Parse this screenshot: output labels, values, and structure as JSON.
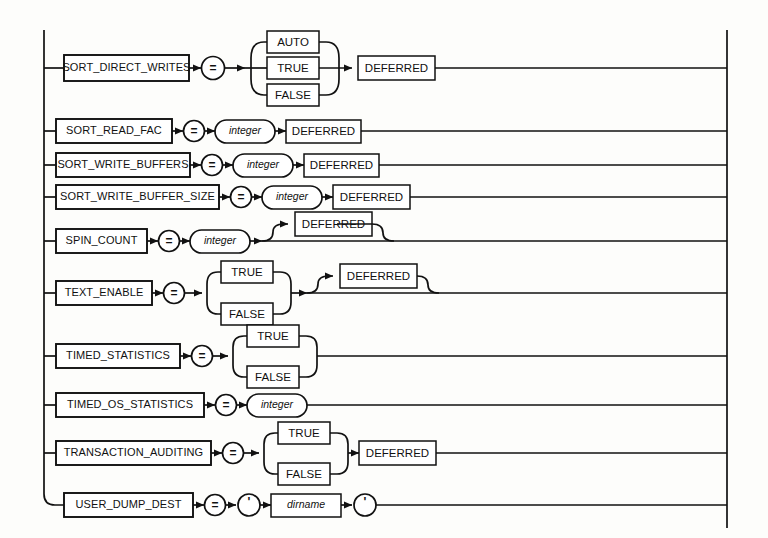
{
  "diagram": {
    "kind": "railroad-syntax-diagram",
    "colors": {
      "ink": "#111111",
      "paper": "#fdfdfb"
    },
    "rail": {
      "left_x": 44,
      "right_x": 727
    },
    "terminals": {
      "auto": "AUTO",
      "true": "TRUE",
      "false": "FALSE",
      "deferred": "DEFERRED",
      "equals": "=",
      "quote": "'"
    },
    "nonterminals": {
      "integer": "integer",
      "dirname": "dirname"
    },
    "rows": [
      {
        "id": "sort-direct-writes",
        "parameter": "SORT_DIRECT_WRITES",
        "operator": "=",
        "choices": [
          "AUTO",
          "TRUE",
          "FALSE"
        ],
        "trailing": "DEFERRED",
        "trailing_optional": false
      },
      {
        "id": "sort-read-fac",
        "parameter": "SORT_READ_FAC",
        "operator": "=",
        "value": "integer",
        "trailing": "DEFERRED",
        "trailing_optional": false
      },
      {
        "id": "sort-write-buffers",
        "parameter": "SORT_WRITE_BUFFERS",
        "operator": "=",
        "value": "integer",
        "trailing": "DEFERRED",
        "trailing_optional": false
      },
      {
        "id": "sort-write-buffer-size",
        "parameter": "SORT_WRITE_BUFFER_SIZE",
        "operator": "=",
        "value": "integer",
        "trailing": "DEFERRED",
        "trailing_optional": false
      },
      {
        "id": "spin-count",
        "parameter": "SPIN_COUNT",
        "operator": "=",
        "value": "integer",
        "trailing": "DEFERRED",
        "trailing_optional": true
      },
      {
        "id": "text-enable",
        "parameter": "TEXT_ENABLE",
        "operator": "=",
        "choices": [
          "TRUE",
          "FALSE"
        ],
        "trailing": "DEFERRED",
        "trailing_optional": true
      },
      {
        "id": "timed-statistics",
        "parameter": "TIMED_STATISTICS",
        "operator": "=",
        "choices": [
          "TRUE",
          "FALSE"
        ],
        "trailing": null,
        "trailing_optional": false
      },
      {
        "id": "timed-os-statistics",
        "parameter": "TIMED_OS_STATISTICS",
        "operator": "=",
        "value": "integer",
        "trailing": null,
        "trailing_optional": false
      },
      {
        "id": "transaction-auditing",
        "parameter": "TRANSACTION_AUDITING",
        "operator": "=",
        "choices": [
          "TRUE",
          "FALSE"
        ],
        "trailing": "DEFERRED",
        "trailing_optional": false
      },
      {
        "id": "user-dump-dest",
        "parameter": "USER_DUMP_DEST",
        "operator": "=",
        "quoted_value": "dirname",
        "quote": "'",
        "trailing": null,
        "trailing_optional": false
      }
    ]
  }
}
